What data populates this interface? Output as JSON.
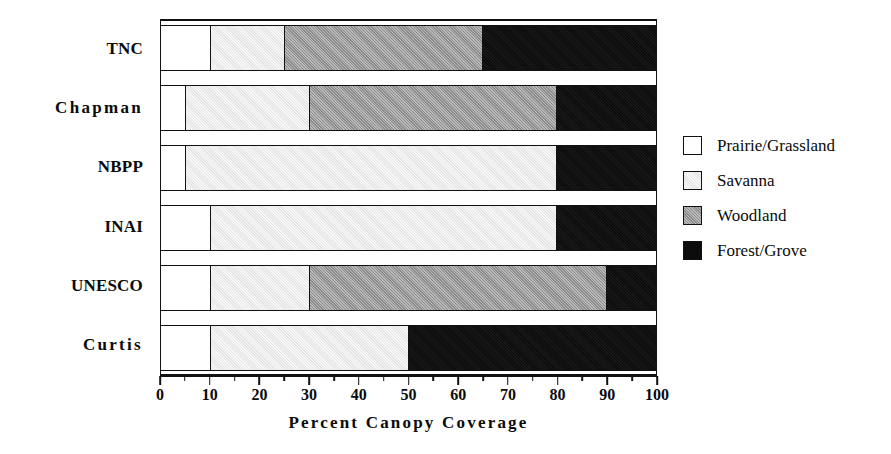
{
  "chart_data": {
    "type": "bar",
    "orientation": "horizontal",
    "stacked": true,
    "title": "",
    "xlabel": "Percent  Canopy  Coverage",
    "ylabel": "",
    "xlim": [
      0,
      100
    ],
    "xticks": [
      0,
      10,
      20,
      30,
      40,
      50,
      60,
      70,
      80,
      90,
      100
    ],
    "xticklabels": [
      "0",
      "10",
      "20",
      "30",
      "40",
      "50",
      "60",
      "70",
      "80",
      "90",
      "100"
    ],
    "minor_ticks": [
      5,
      15,
      25,
      35,
      45,
      55,
      65,
      75,
      85,
      95
    ],
    "grid": false,
    "legend_position": "right",
    "categories": [
      "TNC",
      "Chapman",
      "NBPP",
      "INAI",
      "UNESCO",
      "Curtis"
    ],
    "series": [
      {
        "name": "Prairie/Grassland",
        "color": "#ffffff",
        "values": [
          10,
          5,
          5,
          10,
          10,
          10
        ]
      },
      {
        "name": "Savanna",
        "color": "#e5e5e5",
        "values": [
          15,
          25,
          75,
          70,
          20,
          40
        ]
      },
      {
        "name": "Woodland",
        "color": "#9b9b9b",
        "values": [
          40,
          50,
          0,
          0,
          60,
          0
        ]
      },
      {
        "name": "Forest/Grove",
        "color": "#0c0c0c",
        "values": [
          35,
          20,
          20,
          20,
          10,
          50
        ]
      }
    ],
    "cumulative_boundaries": [
      {
        "category": "TNC",
        "breaks": [
          10,
          25,
          65,
          100
        ]
      },
      {
        "category": "Chapman",
        "breaks": [
          5,
          30,
          80,
          100
        ]
      },
      {
        "category": "NBPP",
        "breaks": [
          5,
          80,
          80,
          100
        ]
      },
      {
        "category": "INAI",
        "breaks": [
          10,
          80,
          80,
          100
        ]
      },
      {
        "category": "UNESCO",
        "breaks": [
          10,
          30,
          90,
          100
        ]
      },
      {
        "category": "Curtis",
        "breaks": [
          10,
          50,
          50,
          100
        ]
      }
    ]
  },
  "axis": {
    "x_title": "Percent  Canopy  Coverage"
  },
  "legend": {
    "items": [
      {
        "label": "Prairie/Grassland",
        "key": "prairie"
      },
      {
        "label": "Savanna",
        "key": "savanna"
      },
      {
        "label": "Woodland",
        "key": "woodland"
      },
      {
        "label": "Forest/Grove",
        "key": "forest"
      }
    ]
  },
  "colors": {
    "prairie": "#ffffff",
    "savanna": "#e5e5e5",
    "woodland": "#9b9b9b",
    "forest": "#0c0c0c",
    "ink": "#111111",
    "background": "#ffffff"
  }
}
